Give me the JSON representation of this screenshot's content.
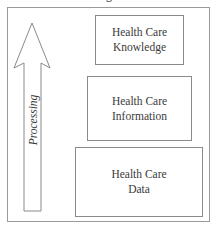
{
  "diagram": {
    "title_fragment": "g",
    "arrow": {
      "label": "Processing",
      "direction": "up"
    },
    "boxes": [
      {
        "id": "knowledge",
        "line1": "Health Care",
        "line2": "Knowledge"
      },
      {
        "id": "information",
        "line1": "Health Care",
        "line2": "Information"
      },
      {
        "id": "data",
        "line1": "Health Care",
        "line2": "Data"
      }
    ],
    "colors": {
      "stroke": "#8a8a8a",
      "text": "#3a3a3a",
      "background": "#ffffff"
    }
  }
}
